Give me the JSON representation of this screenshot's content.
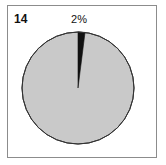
{
  "figure": {
    "number_label": "14",
    "background_color": "#ffffff",
    "frame_color": "#8c8c8c"
  },
  "chart_data": {
    "type": "pie",
    "title": "",
    "subtitle": "",
    "xlabel": "",
    "ylabel": "",
    "grid": false,
    "legend_position": "none",
    "start_angle_deg": 0,
    "direction": "clockwise",
    "labels": [
      "2%",
      ""
    ],
    "categories": [
      "Dark slice",
      "Light slice"
    ],
    "values": [
      2,
      98
    ],
    "value_unit": "percent",
    "colors": [
      "#111111",
      "#c9c9c9"
    ],
    "outline_color": "#333333",
    "annotations": [
      {
        "text": "2%",
        "position": "top",
        "points_to_slice": 0
      }
    ],
    "visible_data_labels": [
      "2%"
    ]
  }
}
